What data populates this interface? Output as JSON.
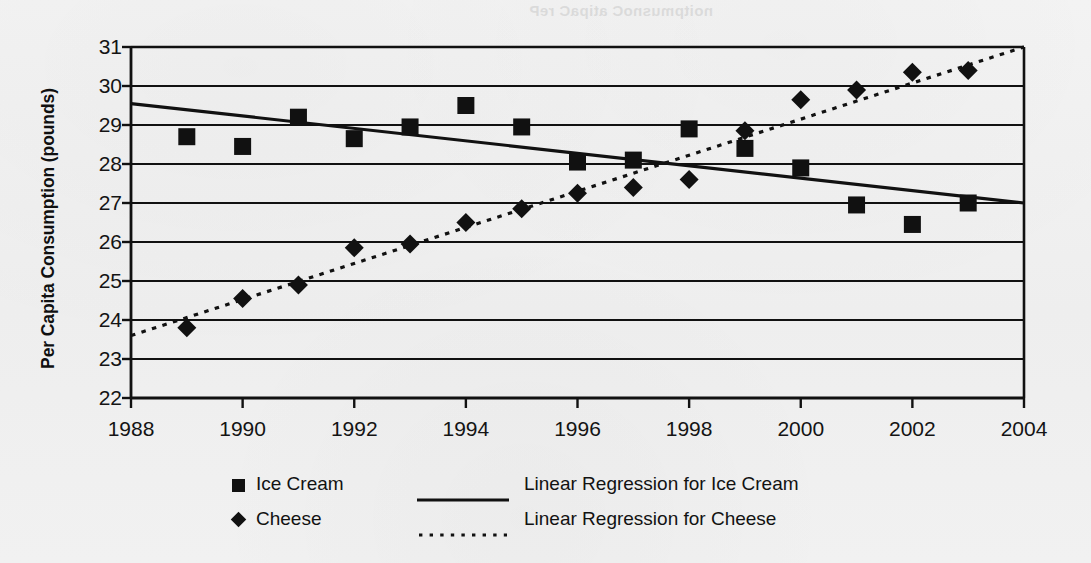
{
  "figure": {
    "background_color": "#f2f2f2",
    "ink_color": "#111111",
    "bleed_through_text": "noitpmusnoC atipaC reP"
  },
  "axes": {
    "y_title": "Per Capita Consumption (pounds)",
    "x_title": "",
    "y_ticks": [
      31,
      30,
      29,
      28,
      27,
      26,
      25,
      24,
      23,
      22
    ],
    "x_ticks": [
      1988,
      1990,
      1992,
      1994,
      1996,
      1998,
      2000,
      2002,
      2004
    ]
  },
  "legend": {
    "entries": [
      {
        "label": "Ice Cream",
        "marker": "square-marker"
      },
      {
        "label": "Cheese",
        "marker": "diamond-marker"
      }
    ],
    "line_entries": [
      {
        "label": "Linear Regression for Ice Cream",
        "style": "solid-line-swatch"
      },
      {
        "label": "Linear Regression for Cheese",
        "style": "dotted-line-swatch"
      }
    ]
  },
  "chart_data": {
    "type": "scatter",
    "title": "",
    "xlabel": "",
    "ylabel": "Per Capita Consumption (pounds)",
    "xlim": [
      1988,
      2004
    ],
    "ylim": [
      22,
      31
    ],
    "xticks": [
      1988,
      1990,
      1992,
      1994,
      1996,
      1998,
      2000,
      2002,
      2004
    ],
    "yticks": [
      22,
      23,
      24,
      25,
      26,
      27,
      28,
      29,
      30,
      31
    ],
    "grid": "horizontal",
    "legend_position": "below-axes",
    "x": [
      1989,
      1990,
      1991,
      1992,
      1993,
      1994,
      1995,
      1996,
      1997,
      1998,
      1999,
      2000,
      2001,
      2002,
      2003
    ],
    "series": [
      {
        "name": "Ice Cream",
        "marker": "square",
        "values": [
          28.7,
          28.45,
          29.2,
          28.65,
          28.95,
          29.5,
          28.95,
          28.05,
          28.1,
          28.9,
          28.4,
          27.9,
          26.95,
          26.45,
          27.0
        ]
      },
      {
        "name": "Cheese",
        "marker": "diamond",
        "values": [
          23.8,
          24.55,
          24.9,
          25.85,
          25.95,
          26.5,
          26.85,
          27.25,
          27.4,
          27.6,
          28.85,
          29.65,
          29.9,
          30.35,
          30.4
        ]
      }
    ],
    "trendlines": [
      {
        "name": "Linear Regression for Ice Cream",
        "style": "solid",
        "x_start": 1988,
        "y_start": 29.55,
        "x_end": 2004,
        "y_end": 27.0
      },
      {
        "name": "Linear Regression for Cheese",
        "style": "dotted",
        "x_start": 1988,
        "y_start": 23.6,
        "x_end": 2004,
        "y_end": 31.0
      }
    ]
  }
}
